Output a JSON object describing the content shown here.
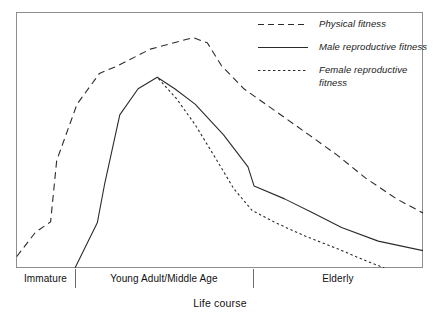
{
  "chart_data": {
    "type": "line",
    "title": "",
    "xlabel": "Life course",
    "ylabel": "",
    "grid": false,
    "legend_position": "top-right",
    "x_stages": [
      {
        "label": "Immature",
        "start": 0.0,
        "end": 0.145
      },
      {
        "label": "Young Adult/Middle Age",
        "start": 0.145,
        "end": 0.582
      },
      {
        "label": "Elderly",
        "start": 0.582,
        "end": 1.0
      }
    ],
    "xlim": [
      0,
      1
    ],
    "ylim": [
      0,
      1
    ],
    "series": [
      {
        "name": "Physical fitness",
        "style": "dashed",
        "color": "#2b2b2b",
        "points": [
          [
            0.002,
            0.045
          ],
          [
            0.048,
            0.14
          ],
          [
            0.085,
            0.18
          ],
          [
            0.1,
            0.42
          ],
          [
            0.15,
            0.64
          ],
          [
            0.205,
            0.76
          ],
          [
            0.25,
            0.79
          ],
          [
            0.33,
            0.855
          ],
          [
            0.435,
            0.9
          ],
          [
            0.47,
            0.88
          ],
          [
            0.505,
            0.79
          ],
          [
            0.56,
            0.7
          ],
          [
            0.64,
            0.61
          ],
          [
            0.72,
            0.52
          ],
          [
            0.79,
            0.44
          ],
          [
            0.86,
            0.35
          ],
          [
            0.935,
            0.27
          ],
          [
            1.0,
            0.215
          ]
        ]
      },
      {
        "name": "Male reproductive fitness",
        "style": "solid",
        "color": "#2b2b2b",
        "points": [
          [
            0.145,
            0.0
          ],
          [
            0.2,
            0.178
          ],
          [
            0.218,
            0.33
          ],
          [
            0.255,
            0.598
          ],
          [
            0.3,
            0.7
          ],
          [
            0.347,
            0.745
          ],
          [
            0.39,
            0.7
          ],
          [
            0.44,
            0.64
          ],
          [
            0.51,
            0.52
          ],
          [
            0.57,
            0.395
          ],
          [
            0.585,
            0.32
          ],
          [
            0.66,
            0.27
          ],
          [
            0.73,
            0.215
          ],
          [
            0.8,
            0.158
          ],
          [
            0.89,
            0.105
          ],
          [
            1.0,
            0.068
          ]
        ]
      },
      {
        "name": "Female reproductive fitness",
        "style": "dotted",
        "color": "#2b2b2b",
        "points": [
          [
            0.35,
            0.74
          ],
          [
            0.395,
            0.66
          ],
          [
            0.44,
            0.56
          ],
          [
            0.49,
            0.43
          ],
          [
            0.535,
            0.31
          ],
          [
            0.58,
            0.225
          ],
          [
            0.64,
            0.175
          ],
          [
            0.71,
            0.125
          ],
          [
            0.79,
            0.075
          ],
          [
            0.86,
            0.028
          ],
          [
            0.905,
            0.0
          ]
        ]
      }
    ],
    "legend_entries": [
      {
        "label": "Physical fitness",
        "style": "dashed"
      },
      {
        "label": "Male reproductive fitness",
        "style": "solid"
      },
      {
        "label": "Female reproductive fitness",
        "style": "dotted"
      }
    ]
  },
  "colors": {
    "stroke": "#2b2b2b",
    "frame": "#8e8e8e",
    "background": "#ffffff",
    "text": "#111111"
  }
}
